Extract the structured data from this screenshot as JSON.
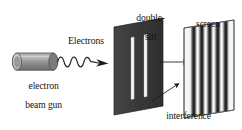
{
  "figure": {
    "width": 242,
    "height": 130,
    "background_color": "#ffffff"
  },
  "labels": {
    "gun_line1": "electron",
    "gun_line2": "beam gun",
    "electrons": "Electrons",
    "double_slit_line1": "double-",
    "double_slit_line2": "slit",
    "screen": "screen",
    "interference_line1": "interference",
    "interference_line2": "pattern"
  },
  "colors": {
    "ink": "#141414",
    "barrier_dark": "#3a3a3a",
    "barrier_edge": "#1d1d1d",
    "slit_white": "#f2f2f2",
    "gun_body": "#8c8c8c",
    "gun_body_light": "#b8b8b8",
    "gun_cap": "#cfcfcf",
    "gun_outline": "#4a4a4a",
    "screen_face": "#f4f4f4",
    "screen_outline": "#5a5a5a",
    "fringe_dark": "#262626",
    "arrow": "#1a1a1a",
    "wave": "#2a2a2a"
  },
  "elements": {
    "electron_gun": {
      "name": "electron beam gun",
      "shape": "horizontal cylinder",
      "x": 10,
      "y": 53,
      "width": 48,
      "height": 17
    },
    "electron_wave": {
      "name": "wavy electron beam arrow",
      "shape": "sinusoid with arrowhead",
      "cycles": 4,
      "from_x": 57,
      "to_x": 108,
      "y": 62
    },
    "double_slit_barrier": {
      "name": "double-slit barrier",
      "shape": "tilted parallelogram plate",
      "slit_count": 2,
      "fill": "#3a3a3a",
      "x": 113,
      "y": 18,
      "width": 51,
      "height": 97
    },
    "middle_arrow": {
      "name": "straight propagation arrow",
      "shape": "horizontal arrow",
      "from_x": 159,
      "to_x": 196,
      "y": 62
    },
    "screen": {
      "name": "detection screen",
      "shape": "tilted parallelogram plate",
      "x": 183,
      "y": 20,
      "width": 52,
      "height": 98
    },
    "interference_pattern": {
      "name": "interference fringes on screen",
      "fringe_count": 5,
      "description": "five dark vertical bands with soft gradient edges"
    },
    "pointer_arrow": {
      "name": "interference pattern pointer arrow",
      "shape": "diagonal arrow pointing up-right",
      "from_x": 152,
      "from_y": 100,
      "to_x": 181,
      "to_y": 84
    }
  }
}
